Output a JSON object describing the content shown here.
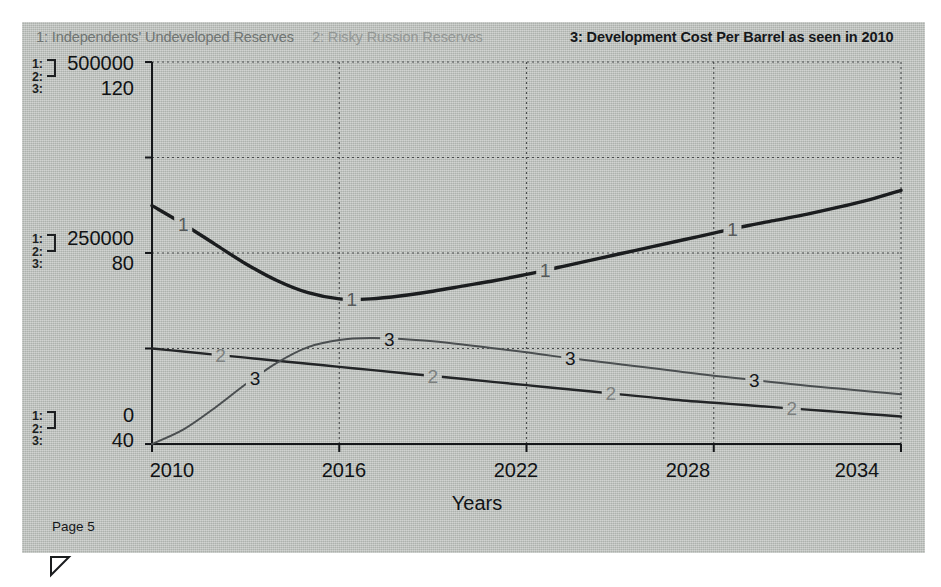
{
  "document": {
    "page_label": "Page 5",
    "resize_handle_icon": "triangle-resize-icon"
  },
  "legend": {
    "items": [
      {
        "id": "1",
        "label": "1: Independents' Undeveloped Reserves",
        "color": "#6f7472"
      },
      {
        "id": "2",
        "label": "2: Risky Russion Reserves",
        "color": "#939795"
      },
      {
        "id": "3",
        "label": "3: Development Cost Per Barrel as seen in 2010",
        "color": "#15171a"
      }
    ]
  },
  "axes": {
    "left_groups": [
      {
        "keys": [
          "1:",
          "2:",
          "3:"
        ],
        "value_12": "500000",
        "value_3": "120"
      },
      {
        "keys": [
          "1:",
          "2:",
          "3:"
        ],
        "value_12": "250000",
        "value_3": "80"
      },
      {
        "keys": [
          "1:",
          "2:",
          "3:"
        ],
        "value_12": "0",
        "value_3": "40"
      }
    ],
    "x_title": "Years",
    "x_ticks": [
      "2010",
      "2016",
      "2022",
      "2028",
      "2034"
    ]
  },
  "chart_data": {
    "type": "line",
    "title": "",
    "subtitle": "",
    "xlabel": "Years",
    "ylabel": "",
    "grid": true,
    "legend_position": "top",
    "x": [
      2010,
      2011,
      2012,
      2013,
      2014,
      2015,
      2016,
      2017,
      2018,
      2019,
      2020,
      2021,
      2022,
      2023,
      2024,
      2025,
      2026,
      2027,
      2028,
      2029,
      2030,
      2031,
      2032,
      2033,
      2034
    ],
    "x_ticks": [
      2010,
      2016,
      2022,
      2028,
      2034
    ],
    "xlim": [
      2010,
      2034
    ],
    "axis_left_12": {
      "applies_to": [
        "1",
        "2"
      ],
      "ticks": [
        0,
        125000,
        250000,
        375000,
        500000
      ],
      "labeled_ticks": [
        0,
        250000,
        500000
      ],
      "ylim": [
        0,
        500000
      ]
    },
    "axis_left_3": {
      "applies_to": [
        "3"
      ],
      "ticks": [
        40,
        60,
        80,
        100,
        120
      ],
      "labeled_ticks": [
        40,
        80,
        120
      ],
      "ylim": [
        40,
        120
      ]
    },
    "series": [
      {
        "name": "1: Independents' Undeveloped Reserves",
        "key": "1",
        "axis": "axis_left_12",
        "color": "#1b1d1f",
        "width": 3.4,
        "marker_labels": [
          {
            "x": 2011.0,
            "text": "1"
          },
          {
            "x": 2016.4,
            "text": "1"
          },
          {
            "x": 2022.6,
            "text": "1"
          },
          {
            "x": 2028.6,
            "text": "1"
          }
        ],
        "values": [
          312000,
          288000,
          262000,
          236000,
          214000,
          198000,
          190000,
          190000,
          194000,
          200000,
          207000,
          214000,
          222000,
          231000,
          240000,
          249000,
          258000,
          267000,
          276000,
          285000,
          293000,
          301000,
          310000,
          320000,
          332000
        ]
      },
      {
        "name": "2: Risky Russion Reserves",
        "key": "2",
        "axis": "axis_left_12",
        "color": "#232527",
        "width": 2.4,
        "marker_labels": [
          {
            "x": 2012.2,
            "text": "2"
          },
          {
            "x": 2019.0,
            "text": "2"
          },
          {
            "x": 2024.7,
            "text": "2"
          },
          {
            "x": 2030.5,
            "text": "2"
          }
        ],
        "values": [
          125000,
          121000,
          117000,
          113000,
          109000,
          105000,
          101000,
          97000,
          93000,
          89000,
          85000,
          81000,
          77000,
          73000,
          69000,
          65000,
          61000,
          57000,
          54000,
          51000,
          48000,
          45000,
          42000,
          39000,
          36000
        ]
      },
      {
        "name": "3: Development Cost Per Barrel as seen in 2010",
        "key": "3",
        "axis": "axis_left_3",
        "color": "#4b4f51",
        "width": 2.0,
        "marker_labels": [
          {
            "x": 2013.3,
            "text": "3"
          },
          {
            "x": 2017.6,
            "text": "3"
          },
          {
            "x": 2023.4,
            "text": "3"
          },
          {
            "x": 2029.3,
            "text": "3"
          }
        ],
        "values": [
          40.0,
          43.0,
          47.5,
          52.5,
          57.0,
          60.3,
          61.8,
          62.2,
          62.0,
          61.5,
          60.8,
          60.0,
          59.2,
          58.3,
          57.5,
          56.7,
          55.9,
          55.1,
          54.3,
          53.6,
          52.9,
          52.2,
          51.6,
          51.0,
          50.4
        ]
      }
    ]
  }
}
